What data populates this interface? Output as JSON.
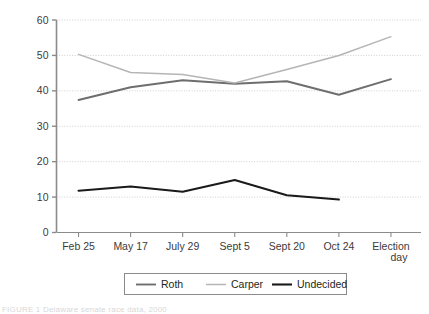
{
  "chart_data": {
    "type": "line",
    "title": "",
    "xlabel": "",
    "ylabel": "Percent",
    "ylim": [
      0,
      60
    ],
    "yticks": [
      0,
      10,
      20,
      30,
      40,
      50,
      60
    ],
    "ytick_labels": [
      "0",
      "10",
      "20",
      "30",
      "40",
      "50",
      "60"
    ],
    "categories": [
      "Feb 25",
      "May 17",
      "July 29",
      "Sept 5",
      "Sept 20",
      "Oct 24",
      "Election day"
    ],
    "grid": "horizontal-dotted",
    "legend_position": "bottom",
    "series": [
      {
        "name": "Roth",
        "color": "#6e6e6e",
        "width": 1.9,
        "values": [
          37.4,
          41.0,
          43.0,
          42.0,
          42.7,
          38.9,
          43.3
        ]
      },
      {
        "name": "Carper",
        "color": "#b5b5b5",
        "width": 1.5,
        "values": [
          50.3,
          45.2,
          44.6,
          42.2,
          46.0,
          50.0,
          55.3
        ]
      },
      {
        "name": "Undecided",
        "color": "#1a1a1a",
        "width": 2.1,
        "values": [
          11.8,
          13.0,
          11.5,
          14.8,
          10.5,
          9.3,
          null
        ]
      }
    ]
  },
  "axes": {
    "y_title": "Percent"
  },
  "legend": {
    "items": [
      {
        "label": "Roth"
      },
      {
        "label": "Carper"
      },
      {
        "label": "Undecided"
      }
    ]
  },
  "caption": {
    "text": "FIGURE 1  Delaware senate race data, 2000"
  }
}
